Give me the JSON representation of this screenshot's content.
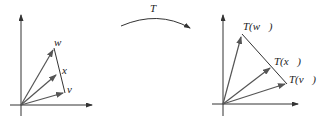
{
  "diagram": {
    "map_label": "T",
    "left": {
      "vectors": [
        {
          "name": "w",
          "label": "w⃗"
        },
        {
          "name": "x",
          "label": "x⃗"
        },
        {
          "name": "v",
          "label": "v⃗"
        }
      ]
    },
    "right": {
      "vectors": [
        {
          "name": "Tw",
          "label": "T(w⃗)"
        },
        {
          "name": "Tx",
          "label": "T(x⃗)"
        },
        {
          "name": "Tv",
          "label": "T(v⃗)"
        }
      ]
    },
    "colors": {
      "axis": "#333333",
      "vector": "#555555",
      "segment": "#333333"
    }
  }
}
